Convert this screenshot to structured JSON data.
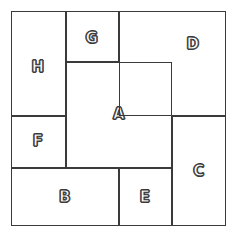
{
  "diagram": {
    "type": "rectangle-packing",
    "background_color": "#ffffff",
    "line_color": "#3a3a3a",
    "label_fill_color": "#ffffff",
    "canvas": {
      "width": 240,
      "height": 238
    },
    "outer_frame": {
      "x": 11,
      "y": 11,
      "width": 215,
      "height": 215
    },
    "regions": [
      {
        "id": "A",
        "label": "A",
        "x": 66,
        "y": 62,
        "width": 106,
        "height": 106,
        "label_x": 119,
        "label_y": 114
      },
      {
        "id": "B",
        "label": "B",
        "x": 11,
        "y": 168,
        "width": 108,
        "height": 58,
        "label_x": 65,
        "label_y": 197
      },
      {
        "id": "C",
        "label": "C",
        "x": 172,
        "y": 116,
        "width": 54,
        "height": 110,
        "label_x": 199,
        "label_y": 171
      },
      {
        "id": "D",
        "label": "D",
        "x": 119,
        "y": 11,
        "width": 107,
        "height": 105,
        "label_x": 193,
        "label_y": 44
      },
      {
        "id": "E",
        "label": "E",
        "x": 119,
        "y": 168,
        "width": 53,
        "height": 58,
        "label_x": 145,
        "label_y": 197
      },
      {
        "id": "F",
        "label": "F",
        "x": 11,
        "y": 116,
        "width": 55,
        "height": 52,
        "label_x": 38,
        "label_y": 141
      },
      {
        "id": "G",
        "label": "G",
        "x": 66,
        "y": 11,
        "width": 53,
        "height": 51,
        "label_x": 92,
        "label_y": 38
      },
      {
        "id": "H",
        "label": "H",
        "x": 11,
        "y": 11,
        "width": 55,
        "height": 105,
        "label_x": 38,
        "label_y": 67
      }
    ]
  }
}
